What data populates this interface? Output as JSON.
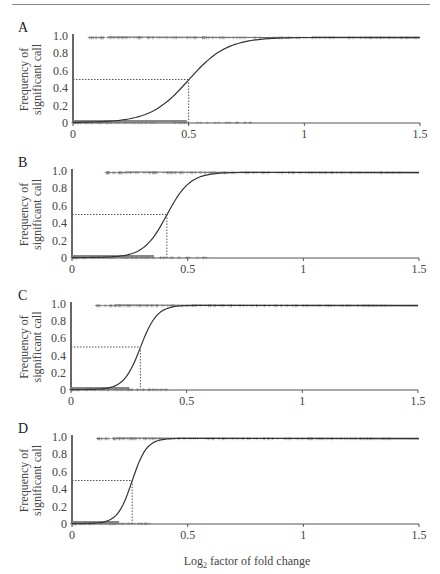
{
  "figure": {
    "xlabel": "Log",
    "xlabel_sub": "2",
    "xlabel_rest": " factor of fold change",
    "ylabel_line1": "Frequency of",
    "ylabel_line2": "significant call"
  },
  "chart_data": [
    {
      "panel": "A",
      "type": "scatter",
      "title": "",
      "xlabel": "",
      "ylabel": "Frequency of significant call",
      "xlim": [
        0,
        1.5
      ],
      "ylim": [
        0,
        1.0
      ],
      "x_ticks": [
        "0",
        "0.5",
        "1",
        "1.5"
      ],
      "y_ticks": [
        "0",
        "0.2",
        "0.4",
        "0.6",
        "0.8",
        "1.0"
      ],
      "grid": false,
      "curve": {
        "type": "logistic",
        "midpoint": 0.5,
        "slope": 12
      },
      "half_point": {
        "x": 0.5,
        "y": 0.5
      },
      "upper_markers_range": [
        0.07,
        1.5
      ],
      "lower_markers_range": [
        0.0,
        0.82
      ]
    },
    {
      "panel": "B",
      "type": "scatter",
      "title": "",
      "xlabel": "",
      "ylabel": "Frequency of significant call",
      "xlim": [
        0,
        1.5
      ],
      "ylim": [
        0,
        1.0
      ],
      "x_ticks": [
        "0",
        "0.5",
        "1",
        "1.5"
      ],
      "y_ticks": [
        "0",
        "0.2",
        "0.4",
        "0.6",
        "0.8",
        "1.0"
      ],
      "grid": false,
      "curve": {
        "type": "logistic",
        "midpoint": 0.41,
        "slope": 20
      },
      "half_point": {
        "x": 0.41,
        "y": 0.5
      },
      "upper_markers_range": [
        0.15,
        1.42
      ],
      "lower_markers_range": [
        0.0,
        0.59
      ]
    },
    {
      "panel": "C",
      "type": "scatter",
      "title": "",
      "xlabel": "",
      "ylabel": "Frequency of significant call",
      "xlim": [
        0,
        1.5
      ],
      "ylim": [
        0,
        1.0
      ],
      "x_ticks": [
        "0",
        "0.5",
        "1",
        "1.5"
      ],
      "y_ticks": [
        "0",
        "0.2",
        "0.4",
        "0.6",
        "0.8",
        "1.0"
      ],
      "grid": false,
      "curve": {
        "type": "logistic",
        "midpoint": 0.3,
        "slope": 28
      },
      "half_point": {
        "x": 0.3,
        "y": 0.5
      },
      "upper_markers_range": [
        0.11,
        1.4
      ],
      "lower_markers_range": [
        0.0,
        0.42
      ]
    },
    {
      "panel": "D",
      "type": "scatter",
      "title": "",
      "xlabel": "Log2 factor of fold change",
      "ylabel": "Frequency of significant call",
      "xlim": [
        0,
        1.5
      ],
      "ylim": [
        0,
        1.0
      ],
      "x_ticks": [
        "0",
        "0.5",
        "1",
        "1.5"
      ],
      "y_ticks": [
        "0",
        "0.2",
        "0.4",
        "0.6",
        "0.8",
        "1.0"
      ],
      "grid": false,
      "curve": {
        "type": "logistic",
        "midpoint": 0.26,
        "slope": 32
      },
      "half_point": {
        "x": 0.26,
        "y": 0.5
      },
      "upper_markers_range": [
        0.11,
        1.4
      ],
      "lower_markers_range": [
        0.0,
        0.34
      ]
    }
  ]
}
